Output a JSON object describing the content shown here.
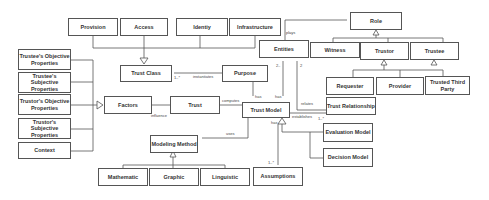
{
  "boxes": {
    "provision": "Provision",
    "access": "Access",
    "identity": "Identiy",
    "infrastructure": "Infrastructure",
    "role": "Role",
    "entities": "Entities",
    "witness": "Witness",
    "trustor": "Trustor",
    "trustee": "Trustee",
    "trust_class": "Trust Class",
    "purpose": "Purpose",
    "requester": "Requester",
    "provider": "Provider",
    "trusted_third_party": "Trusted Third Party",
    "trustees_objective": "Trustee's Objective Properties",
    "trustees_subjective": "Trustee's Subjective Properties",
    "trustors_objective": "Trustor's Objective Properties",
    "trustors_subjective": "Trustor's Subjective Properties",
    "context": "Context",
    "factors": "Factors",
    "trust": "Trust",
    "trust_model": "Trust Model",
    "trust_relationship": "Trust Relationship",
    "evaluation_model": "Evaluation Model",
    "decision_model": "Decision Model",
    "modeling_method": "Modeling Method",
    "mathematic": "Mathematic",
    "graphic": "Graphic",
    "linguistic": "Linguistic",
    "assumptions": "Assumptions"
  },
  "labels": {
    "plays": "plays",
    "instantiates": "instantiates",
    "mult_1n_a": "1..*",
    "mult_2": "2",
    "mult_2b": "2..",
    "has_purpose": "has",
    "has_entities": "has",
    "has_assumptions": "has",
    "mult_assumptions": "1..*",
    "computes": "computes",
    "influences": "influence",
    "relates": "relates",
    "establishes": "establishes",
    "mult_rel": "1..*",
    "uses": "uses"
  }
}
